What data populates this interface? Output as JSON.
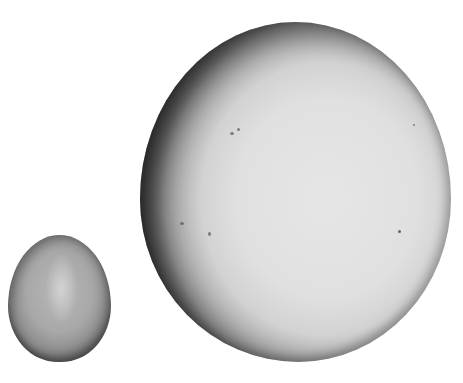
{
  "image": {
    "description": "Grayscale photograph of two eggs on a white background: a small oval egg at lower left and a very large, nearly spherical egg to its right.",
    "background_color": "#ffffff",
    "objects": [
      {
        "name": "small-egg",
        "tone": "medium gray",
        "bbox": [
          8,
          235,
          111,
          362
        ]
      },
      {
        "name": "large-egg",
        "tone": "light gray with dark shaded left edge and small specks",
        "bbox": [
          140,
          22,
          451,
          362
        ]
      }
    ]
  }
}
